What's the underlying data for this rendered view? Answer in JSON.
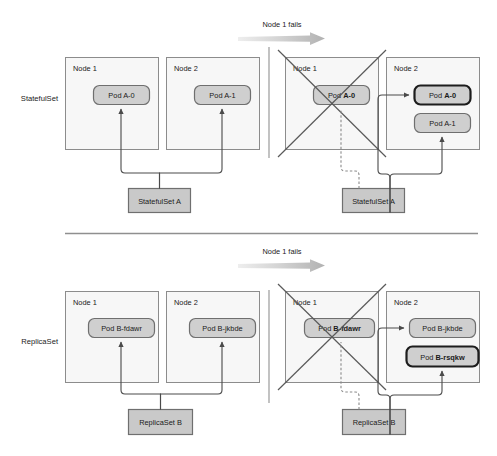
{
  "figure": {
    "title_present": false,
    "colors": {
      "node_fill": "#f7f7f7",
      "node_stroke": "#8c8c8c",
      "pod_fill": "#cfcfcf",
      "pod_stroke": "#6f6f6f",
      "new_pod_stroke": "#1d1d1d",
      "controller_fill": "#c9c9c9",
      "connector": "#4a4a4a",
      "dashed_connector": "#8a8a8a",
      "x_mark": "#5a5a5a",
      "fail_arrow": "#c4c4c4",
      "text": "#1a1a1a"
    }
  },
  "rows": [
    {
      "id": "statefulset-row",
      "side_label": "StatefulSet",
      "transition_caption": "Node 1 fails",
      "before": {
        "nodes": [
          {
            "title": "Node 1",
            "pods": [
              {
                "prefix": "Pod ",
                "name": "A-0",
                "bold": false,
                "highlighted": false
              }
            ]
          },
          {
            "title": "Node 2",
            "pods": [
              {
                "prefix": "Pod ",
                "name": "A-1",
                "bold": false,
                "highlighted": false
              }
            ]
          }
        ],
        "controller": "StatefulSet A"
      },
      "after": {
        "nodes": [
          {
            "title": "Node 1",
            "failed": true,
            "pods": [
              {
                "prefix": "Pod ",
                "name": "A-0",
                "bold": true,
                "highlighted": false
              }
            ]
          },
          {
            "title": "Node 2",
            "failed": false,
            "pods": [
              {
                "prefix": "Pod ",
                "name": "A-0",
                "bold": true,
                "highlighted": true
              },
              {
                "prefix": "Pod ",
                "name": "A-1",
                "bold": false,
                "highlighted": false
              }
            ]
          }
        ],
        "controller": "StatefulSet A"
      }
    },
    {
      "id": "replicaset-row",
      "side_label": "ReplicaSet",
      "transition_caption": "Node 1 fails",
      "before": {
        "nodes": [
          {
            "title": "Node 1",
            "pods": [
              {
                "prefix": "Pod ",
                "name": "B-fdawr",
                "bold": false,
                "highlighted": false
              }
            ]
          },
          {
            "title": "Node 2",
            "pods": [
              {
                "prefix": "Pod ",
                "name": "B-jkbde",
                "bold": false,
                "highlighted": false
              }
            ]
          }
        ],
        "controller": "ReplicaSet B"
      },
      "after": {
        "nodes": [
          {
            "title": "Node 1",
            "failed": true,
            "pods": [
              {
                "prefix": "Pod ",
                "name": "B-fdawr",
                "bold": true,
                "highlighted": false
              }
            ]
          },
          {
            "title": "Node 2",
            "failed": false,
            "pods": [
              {
                "prefix": "Pod ",
                "name": "B-jkbde",
                "bold": false,
                "highlighted": false
              },
              {
                "prefix": "Pod ",
                "name": "B-rsqkw",
                "bold": true,
                "highlighted": true
              }
            ]
          }
        ],
        "controller": "ReplicaSet B"
      }
    }
  ]
}
